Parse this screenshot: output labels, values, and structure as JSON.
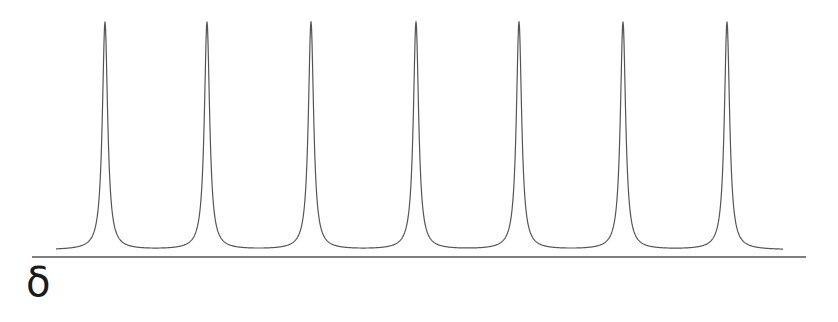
{
  "figure": {
    "axis_symbol": "δ",
    "curve_color": "#555555",
    "axis_color": "#555555"
  },
  "chart_data": {
    "type": "line",
    "title": "",
    "xlabel": "δ",
    "ylabel": "",
    "grid": false,
    "legend": null,
    "series": [
      {
        "name": "signal",
        "peak_count": 7,
        "peak_positions_px": [
          105,
          207,
          311,
          416,
          519,
          623,
          727
        ],
        "peak_top_px": 22,
        "baseline_px": 250,
        "x_start_px": 56,
        "x_end_px": 783,
        "relative_peak_heights": [
          1,
          1,
          1,
          1,
          1,
          1,
          1
        ]
      }
    ],
    "axis": {
      "x1_px": 32,
      "x2_px": 806,
      "y_px": 257
    }
  }
}
